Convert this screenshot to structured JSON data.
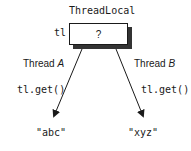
{
  "diagram": {
    "title": "ThreadLocal",
    "variable_label": "tl",
    "box_content": "?",
    "threads": [
      {
        "name": "Thread",
        "id": "A",
        "call": "tl.get()",
        "result": "\"abc\""
      },
      {
        "name": "Thread",
        "id": "B",
        "call": "tl.get()",
        "result": "\"xyz\""
      }
    ],
    "colors": {
      "line": "#1a1a1a",
      "shadow": "#333333",
      "background": "#ffffff"
    }
  }
}
